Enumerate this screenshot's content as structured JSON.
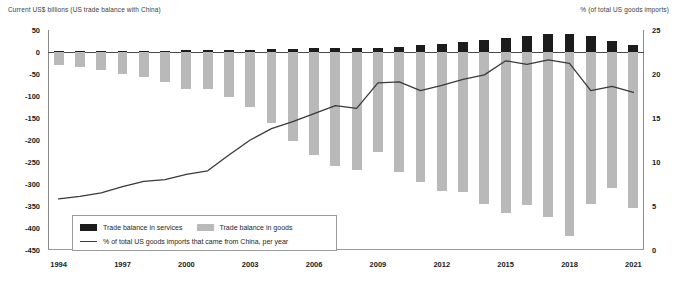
{
  "axes": {
    "left_title": "Current US$ billions (US trade balance with China)",
    "right_title": "% (of total US goods imports)",
    "left_ticks": [
      "50",
      "0",
      "-50",
      "-100",
      "-150",
      "-200",
      "-250",
      "-300",
      "-350",
      "-400",
      "-450"
    ],
    "right_ticks": [
      "25",
      "20",
      "15",
      "10",
      "5",
      "0"
    ],
    "x_ticks": [
      "1994",
      "1997",
      "2000",
      "2003",
      "2006",
      "2009",
      "2012",
      "2015",
      "2018",
      "2021"
    ]
  },
  "legend": {
    "services_label": "Trade balance in services",
    "goods_label": "Trade balance in goods",
    "line_label": "% of total US goods imports that came from China, per year"
  },
  "colors": {
    "services": "#1c1c1c",
    "goods": "#b9b9b9",
    "line": "#3a3a3a",
    "axis": "#8a8a8a"
  },
  "chart_data": {
    "type": "bar",
    "title": "",
    "subtitle": "",
    "xlabel": "",
    "ylabel": "Current US$ billions (US trade balance with China)",
    "y2label": "% (of total US goods imports)",
    "ylim": [
      -450,
      50
    ],
    "y2lim": [
      0,
      25
    ],
    "grid": false,
    "legend_position": "inside-bottom-left",
    "categories": [
      "1994",
      "1995",
      "1996",
      "1997",
      "1998",
      "1999",
      "2000",
      "2001",
      "2002",
      "2003",
      "2004",
      "2005",
      "2006",
      "2007",
      "2008",
      "2009",
      "2010",
      "2011",
      "2012",
      "2013",
      "2014",
      "2015",
      "2016",
      "2017",
      "2018",
      "2019",
      "2020",
      "2021"
    ],
    "series": [
      {
        "name": "Trade balance in goods",
        "type": "bar",
        "axis": "left",
        "color": "#b9b9b9",
        "values": [
          -29,
          -34,
          -40,
          -50,
          -57,
          -69,
          -84,
          -83,
          -103,
          -124,
          -162,
          -202,
          -234,
          -258,
          -268,
          -227,
          -273,
          -295,
          -315,
          -319,
          -345,
          -367,
          -347,
          -376,
          -419,
          -345,
          -310,
          -355
        ]
      },
      {
        "name": "Trade balance in services",
        "type": "bar",
        "axis": "left",
        "color": "#1c1c1c",
        "values": [
          2,
          2,
          2,
          3,
          3,
          3,
          4,
          4,
          4,
          5,
          6,
          7,
          8,
          9,
          10,
          10,
          12,
          15,
          18,
          22,
          27,
          32,
          36,
          40,
          40,
          36,
          24,
          15
        ]
      },
      {
        "name": "% of total US goods imports that came from China, per year",
        "type": "line",
        "axis": "right",
        "color": "#3a3a3a",
        "values": [
          5.8,
          6.1,
          6.5,
          7.2,
          7.8,
          8.0,
          8.6,
          9.0,
          10.8,
          12.5,
          13.8,
          14.6,
          15.5,
          16.4,
          16.1,
          19.0,
          19.1,
          18.1,
          18.7,
          19.4,
          19.9,
          21.5,
          21.1,
          21.6,
          21.2,
          18.1,
          18.6,
          17.9
        ]
      }
    ]
  }
}
